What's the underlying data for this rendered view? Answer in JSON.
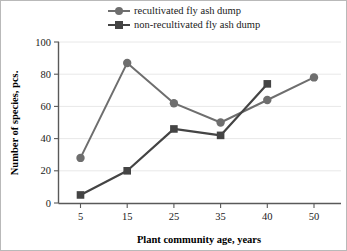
{
  "chart_data": {
    "type": "line",
    "title": "",
    "xlabel": "Plant community age, years",
    "ylabel": "Number of species, pcs.",
    "categories": [
      "5",
      "15",
      "25",
      "35",
      "40",
      "50"
    ],
    "ylim": [
      0,
      100
    ],
    "yticks": [
      "0",
      "20",
      "40",
      "60",
      "80",
      "100"
    ],
    "grid": true,
    "legend_position": "top",
    "series": [
      {
        "name": "recultivated fly ash dump",
        "marker": "circle",
        "color": "#6e6e6e",
        "values": [
          28,
          87,
          62,
          50,
          64,
          78
        ]
      },
      {
        "name": "non-recultivated fly ash dump",
        "marker": "square",
        "color": "#444444",
        "values": [
          5,
          20,
          46,
          42,
          74,
          null
        ]
      }
    ]
  },
  "legend": {
    "items": [
      {
        "label": "recultivated fly ash dump"
      },
      {
        "label": "non-recultivated fly ash dump"
      }
    ]
  },
  "axes": {
    "y_title": "Number of species, pcs.",
    "x_title": "Plant community age, years",
    "y_ticks": [
      "100",
      "80",
      "60",
      "40",
      "20",
      "0"
    ],
    "x_ticks": [
      "5",
      "15",
      "25",
      "35",
      "40",
      "50"
    ]
  }
}
